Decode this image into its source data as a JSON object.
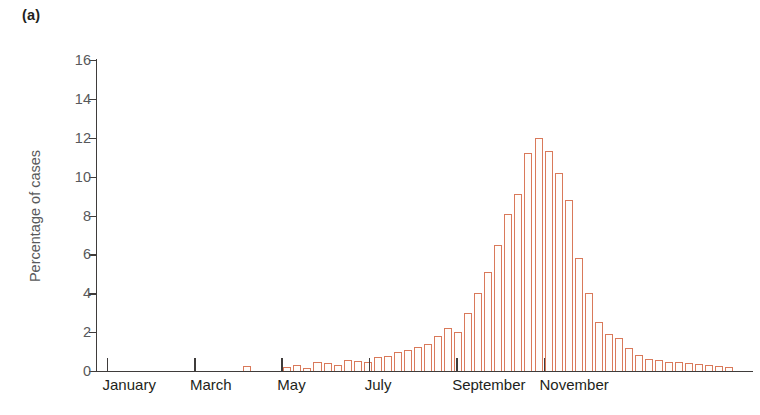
{
  "panel": {
    "label": "(a)"
  },
  "axes": {
    "y_title": "Percentage of cases",
    "y_ticks": [
      "0",
      "2",
      "4",
      "6",
      "8",
      "10",
      "12",
      "14",
      "16"
    ],
    "x_ticks": [
      "January",
      "March",
      "May",
      "July",
      "September",
      "November"
    ]
  },
  "style": {
    "bar_outline": "#d9795a",
    "bar_fill": "#fffdfb",
    "axis_color": "#3f3c3b",
    "tick_label_color": "#58595b",
    "month_label_color": "#231f20",
    "background": "#ffffff"
  },
  "chart_data": {
    "type": "bar",
    "title": "",
    "xlabel": "",
    "ylabel": "Percentage of cases",
    "ylim": [
      0,
      16
    ],
    "ytick_values": [
      0,
      2,
      4,
      6,
      8,
      10,
      12,
      14,
      16
    ],
    "grid": false,
    "legend": null,
    "xtick_labels": [
      "January",
      "March",
      "May",
      "July",
      "September",
      "November"
    ],
    "xtick_positions": [
      0,
      8.7,
      17.4,
      26.1,
      34.8,
      43.5
    ],
    "x_unit": "week",
    "categories": [
      "W1",
      "W2",
      "W3",
      "W4",
      "W5",
      "W6",
      "W7",
      "W8",
      "W9",
      "W10",
      "W11",
      "W12",
      "W13",
      "W14",
      "W15",
      "W16",
      "W17",
      "W18",
      "W19",
      "W20",
      "W21",
      "W22",
      "W23",
      "W24",
      "W25",
      "W26",
      "W27",
      "W28",
      "W29",
      "W30",
      "W31",
      "W32",
      "W33",
      "W34",
      "W35",
      "W36",
      "W37",
      "W38",
      "W39",
      "W40",
      "W41",
      "W42",
      "W43",
      "W44",
      "W45",
      "W46",
      "W47",
      "W48",
      "W49",
      "W50",
      "W51",
      "W52",
      "W53",
      "W54",
      "W55"
    ],
    "values": [
      0,
      0,
      0,
      0,
      0,
      0,
      0,
      0,
      0,
      0,
      0,
      0,
      0,
      0,
      0.25,
      0,
      0,
      0,
      0.2,
      0.3,
      0.15,
      0.45,
      0.4,
      0.3,
      0.55,
      0.5,
      0.45,
      0.7,
      0.75,
      1.0,
      1.1,
      1.25,
      1.4,
      1.8,
      2.2,
      2.0,
      3.0,
      4.0,
      5.1,
      6.5,
      8.1,
      9.1,
      11.2,
      12.0,
      11.3,
      10.2,
      8.8,
      5.8,
      4.0,
      2.5,
      1.9,
      1.7,
      1.2,
      0.8,
      0.6
    ],
    "tail_values": [
      0.55,
      0.45,
      0.45,
      0.4,
      0.35,
      0.3,
      0.25,
      0.2
    ],
    "peak": {
      "category": "W44",
      "value": 12.0,
      "approx_month": "late August / early September"
    }
  }
}
